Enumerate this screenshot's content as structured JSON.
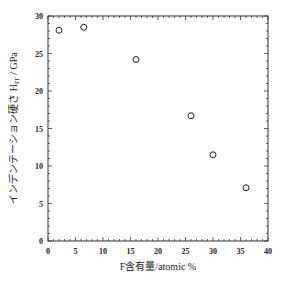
{
  "chart_data": {
    "type": "scatter",
    "title": "",
    "xlabel": "F含有量/atomic %",
    "ylabel": "インデンテーション硬さ H_IT / GPa",
    "ylabel_main": "インデンテーション硬さ H",
    "ylabel_sub": "IT",
    "ylabel_unit": " / GPa",
    "xlim": [
      0,
      40
    ],
    "ylim": [
      0,
      30
    ],
    "xticks": [
      0,
      5,
      10,
      15,
      20,
      25,
      30,
      35,
      40
    ],
    "yticks": [
      0,
      5,
      10,
      15,
      20,
      25,
      30
    ],
    "grid": false,
    "legend": null,
    "marker": "open-circle",
    "series": [
      {
        "name": "H_IT",
        "x": [
          2,
          6.5,
          16,
          26,
          30,
          36
        ],
        "y": [
          28.1,
          28.5,
          24.2,
          16.7,
          11.5,
          7.1
        ]
      }
    ]
  }
}
